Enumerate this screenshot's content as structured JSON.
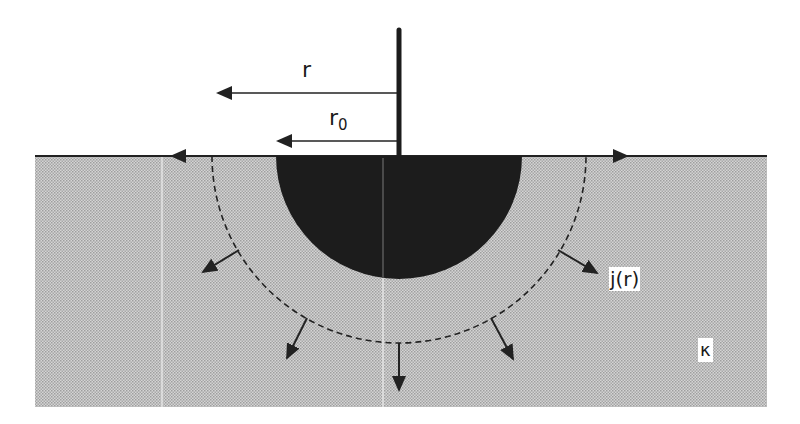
{
  "diagram": {
    "type": "hemispherical-electrode-current-spreading",
    "labels": {
      "r": "r",
      "r0_base": "r",
      "r0_sub": "0",
      "current_density": "j(r)",
      "conductivity": "κ"
    },
    "colors": {
      "ground_fill": "#c8c8c8",
      "ground_pattern_dark": "#a9a9a9",
      "electrode": "#1c1c1c",
      "lines": "#222222",
      "background": "#ffffff"
    },
    "geometry": {
      "surface_y": 156,
      "ground_left": 35,
      "ground_right": 767,
      "ground_bottom": 407,
      "center_x": 399,
      "electrode_radius": 123,
      "dashed_radius": 187,
      "rod_top_y": 30
    }
  }
}
